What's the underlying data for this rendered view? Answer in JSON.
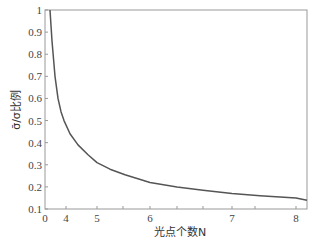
{
  "chart_data": {
    "type": "line",
    "title": "",
    "xlabel": "光点个数N",
    "ylabel": "σ̄/σ比例",
    "x_tick_labels": [
      {
        "label": "0",
        "px": 45
      },
      {
        "label": "4",
        "px": 66
      },
      {
        "label": "5",
        "px": 97
      },
      {
        "label": "6",
        "px": 150
      },
      {
        "label": "7",
        "px": 232
      },
      {
        "label": "8",
        "px": 296
      }
    ],
    "x_minor_ticks_px": [
      123,
      177,
      203,
      255
    ],
    "y_ticks": [
      0.1,
      0.2,
      0.3,
      0.4,
      0.5,
      0.6,
      0.7,
      0.8,
      0.9,
      1
    ],
    "y_tick_labels": [
      "0.1",
      "0.2",
      "0.3",
      "0.4",
      "0.5",
      "0.6",
      "0.7",
      "0.8",
      "0.9",
      "1"
    ],
    "ylim": [
      0.1,
      1
    ],
    "grid": false,
    "legend": null,
    "series": [
      {
        "name": "σ̄/σ",
        "color": "#555555",
        "points_px_x": [
          50,
          52,
          55,
          58,
          61,
          64,
          70,
          78,
          88,
          97,
          110,
          125,
          150,
          177,
          203,
          232,
          260,
          296,
          307
        ],
        "values": [
          1.0,
          0.86,
          0.7,
          0.6,
          0.54,
          0.5,
          0.44,
          0.39,
          0.345,
          0.31,
          0.28,
          0.255,
          0.22,
          0.2,
          0.185,
          0.17,
          0.16,
          0.15,
          0.14
        ]
      }
    ]
  },
  "plot": {
    "left": 45,
    "top": 10,
    "right": 307,
    "bottom": 209,
    "axis_color": "#999999",
    "line_color": "#555555"
  }
}
